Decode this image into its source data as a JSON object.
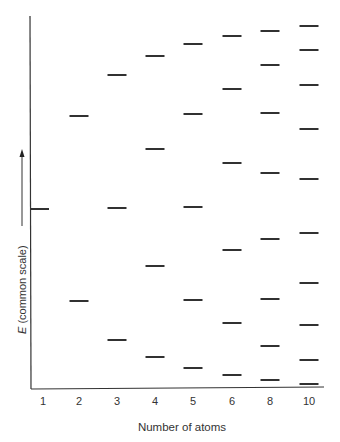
{
  "chart_data": {
    "type": "energy-level-diagram",
    "title": "",
    "xlabel": "Number of atoms",
    "ylabel": "E (common scale)",
    "ylabel_italic_part": "E",
    "ylabel_rest": " (common scale)",
    "y_axis_arrow": "up",
    "categories": [
      "1",
      "2",
      "3",
      "4",
      "5",
      "6",
      "8",
      "10"
    ],
    "ylim": [
      -2,
      2
    ],
    "levels": [
      {
        "n": "1",
        "values": [
          0.0
        ]
      },
      {
        "n": "2",
        "values": [
          1.0,
          -1.0
        ]
      },
      {
        "n": "3",
        "values": [
          1.414,
          0.0,
          -1.414
        ]
      },
      {
        "n": "4",
        "values": [
          1.618,
          0.618,
          -0.618,
          -1.618
        ]
      },
      {
        "n": "5",
        "values": [
          1.732,
          1.0,
          0.0,
          -1.0,
          -1.732
        ]
      },
      {
        "n": "6",
        "values": [
          1.802,
          1.247,
          0.445,
          -0.445,
          -1.247,
          -1.802
        ]
      },
      {
        "n": "8",
        "values": [
          1.879,
          1.532,
          1.0,
          0.347,
          -0.347,
          -1.0,
          -1.532,
          -1.879
        ]
      },
      {
        "n": "10",
        "values": [
          1.919,
          1.683,
          1.31,
          0.831,
          0.285,
          -0.285,
          -0.831,
          -1.31,
          -1.683,
          -1.919
        ]
      }
    ],
    "level_pixel_y": [
      {
        "n": "1",
        "y": [
          209
        ]
      },
      {
        "n": "2",
        "y": [
          116,
          301
        ]
      },
      {
        "n": "3",
        "y": [
          75,
          208,
          340
        ]
      },
      {
        "n": "4",
        "y": [
          56,
          149,
          266,
          357
        ]
      },
      {
        "n": "5",
        "y": [
          44,
          114,
          207,
          300,
          368
        ]
      },
      {
        "n": "6",
        "y": [
          36,
          89,
          163,
          250,
          323,
          375
        ]
      },
      {
        "n": "8",
        "y": [
          31,
          65,
          113,
          173,
          239,
          299,
          346,
          380
        ]
      },
      {
        "n": "10",
        "y": [
          26,
          50,
          85,
          129,
          179,
          233,
          283,
          325,
          360,
          384
        ]
      }
    ],
    "column_x": [
      41,
      79,
      117,
      155,
      193,
      232,
      270,
      309
    ],
    "grid": false,
    "legend": null
  }
}
